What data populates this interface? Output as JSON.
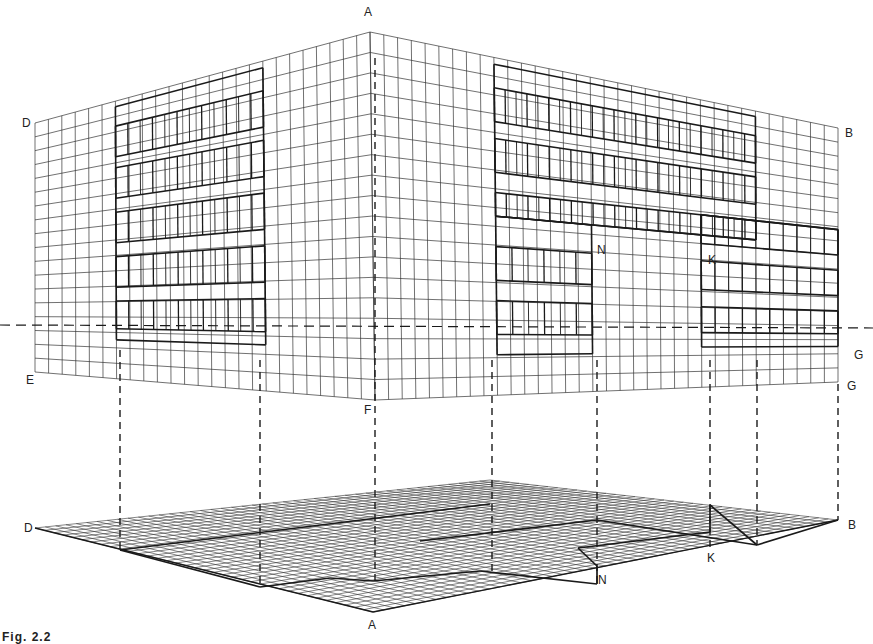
{
  "figure": {
    "caption": "Fig. 2.2"
  },
  "labels": {
    "elevation": [
      {
        "id": "A",
        "text": "A",
        "x": 364,
        "y": 6
      },
      {
        "id": "D",
        "text": "D",
        "x": 22,
        "y": 117
      },
      {
        "id": "B",
        "text": "B",
        "x": 845,
        "y": 127
      },
      {
        "id": "E",
        "text": "E",
        "x": 26,
        "y": 374
      },
      {
        "id": "F",
        "text": "F",
        "x": 364,
        "y": 404
      },
      {
        "id": "N",
        "text": "N",
        "x": 597,
        "y": 244
      },
      {
        "id": "K",
        "text": "K",
        "x": 708,
        "y": 254
      },
      {
        "id": "G1",
        "text": "G",
        "x": 854,
        "y": 349
      },
      {
        "id": "G2",
        "text": "G",
        "x": 847,
        "y": 380
      }
    ],
    "plan": [
      {
        "id": "D",
        "text": "D",
        "x": 24,
        "y": 522
      },
      {
        "id": "B",
        "text": "B",
        "x": 848,
        "y": 519
      },
      {
        "id": "A",
        "text": "A",
        "x": 368,
        "y": 619
      },
      {
        "id": "N",
        "text": "N",
        "x": 598,
        "y": 574
      },
      {
        "id": "K",
        "text": "K",
        "x": 707,
        "y": 552
      }
    ]
  },
  "geometry": {
    "horizon_y": 325,
    "line_color": "#333333",
    "heavy_color": "#1a1a1a",
    "left_face": {
      "top_left": [
        35,
        123
      ],
      "top_right": [
        370,
        32
      ],
      "bottom_left": [
        35,
        372
      ],
      "bottom_right": [
        375,
        400
      ],
      "cols": 25,
      "rows": 18
    },
    "right_face": {
      "top_left": [
        370,
        32
      ],
      "top_right": [
        838,
        128
      ],
      "bottom_left": [
        375,
        400
      ],
      "bottom_right": [
        838,
        382
      ],
      "cols": 34,
      "rows": 18
    },
    "plan": {
      "left": [
        35,
        528
      ],
      "front": [
        373,
        612
      ],
      "right": [
        838,
        520
      ],
      "back": [
        490,
        480
      ],
      "u_div": 36,
      "v_div": 44
    },
    "projectors_x": [
      120,
      260,
      375,
      492,
      597,
      710,
      757,
      838
    ]
  }
}
